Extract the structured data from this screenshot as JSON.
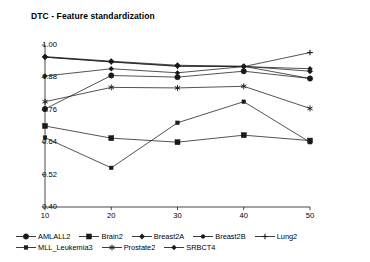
{
  "chart_data": {
    "type": "line",
    "title": "DTC - Feature standardization",
    "xlabel": "",
    "ylabel": "",
    "x": [
      10,
      20,
      30,
      40,
      50
    ],
    "xtick_labels": [
      "10",
      "20",
      "30",
      "40",
      "50"
    ],
    "ytick_labels": [
      "1.00",
      "0.88",
      "0.76",
      "0.64",
      "0.52",
      "0.40"
    ],
    "ytick_values": [
      1.0,
      0.88,
      0.76,
      0.64,
      0.52,
      0.4
    ],
    "ylim": [
      0.4,
      1.0
    ],
    "xlim": [
      10,
      50
    ],
    "grid": false,
    "legend_position": "bottom",
    "series": [
      {
        "name": "AMLALL2",
        "marker": "filled-circle",
        "values": [
          0.763,
          0.887,
          0.881,
          0.903,
          0.876
        ]
      },
      {
        "name": "Brain2",
        "marker": "filled-square",
        "values": [
          0.7,
          0.655,
          0.64,
          0.666,
          0.646
        ]
      },
      {
        "name": "Breast2A",
        "marker": "filled-diamond",
        "values": [
          0.957,
          0.94,
          0.925,
          0.921,
          0.903
        ]
      },
      {
        "name": "Breast2B",
        "marker": "filled-circle-small",
        "values": [
          0.955,
          0.938,
          0.922,
          0.921,
          0.876
        ]
      },
      {
        "name": "Lung2",
        "marker": "plus",
        "values": [
          0.955,
          0.937,
          0.921,
          0.92,
          0.972
        ]
      },
      {
        "name": "MLL_Leukemia3",
        "marker": "filled-square-small",
        "values": [
          0.657,
          0.545,
          0.712,
          0.79,
          0.64
        ]
      },
      {
        "name": "Prostate2",
        "marker": "star",
        "values": [
          0.79,
          0.843,
          0.841,
          0.847,
          0.765
        ]
      },
      {
        "name": "SRBCT4",
        "marker": "diamond",
        "values": [
          0.885,
          0.912,
          0.897,
          0.92,
          0.912
        ]
      }
    ]
  },
  "legend": {
    "row1": [
      {
        "label": "AMLALL2",
        "marker": "filled-circle"
      },
      {
        "label": "Brain2",
        "marker": "filled-square"
      },
      {
        "label": "Breast2A",
        "marker": "filled-diamond"
      },
      {
        "label": "Breast2B",
        "marker": "filled-circle-small"
      },
      {
        "label": "Lung2",
        "marker": "plus"
      }
    ],
    "row2": [
      {
        "label": "MLL_Leukemia3",
        "marker": "filled-square-small"
      },
      {
        "label": "Prostate2",
        "marker": "star"
      },
      {
        "label": "SRBCT4",
        "marker": "diamond"
      }
    ]
  },
  "colors": {
    "line": "#1a1a1a",
    "axis": "#1a1a1a",
    "background": "#ffffff"
  }
}
